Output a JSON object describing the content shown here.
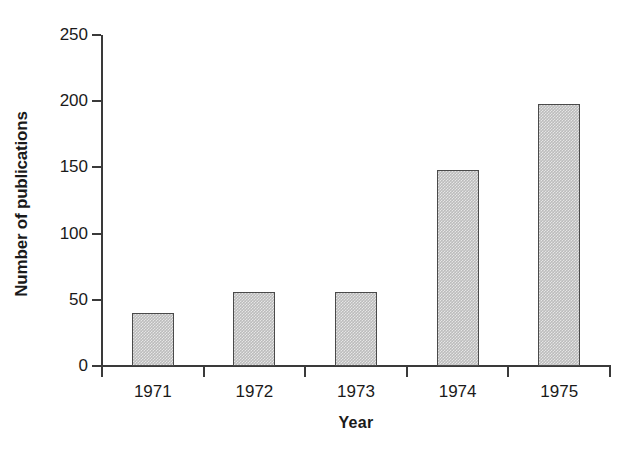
{
  "chart_data": {
    "type": "bar",
    "title": "",
    "subtitle": "",
    "xlabel": "Year",
    "ylabel": "Number of publications",
    "categories": [
      "1971",
      "1972",
      "1973",
      "1974",
      "1975"
    ],
    "values": [
      40,
      56,
      56,
      148,
      198
    ],
    "ylim": [
      0,
      250
    ],
    "yticks": [
      0,
      50,
      100,
      150,
      200,
      250
    ],
    "ytick_labels": [
      "0",
      "50",
      "100",
      "150",
      "200",
      "250"
    ],
    "grid": false,
    "legend": "none",
    "series": [
      {
        "name": "Number of publications",
        "values": [
          40,
          56,
          56,
          148,
          198
        ]
      }
    ],
    "colors": {
      "bar_fill": "#bcbcbc",
      "bar_edge": "#4a4a4a",
      "axis": "#3a3a3a",
      "text": "#1a1a1a",
      "background": "#ffffff"
    }
  }
}
